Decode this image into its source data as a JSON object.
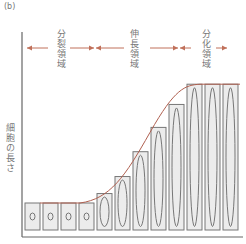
{
  "panel_label": "(b)",
  "y_axis_label": "細胞の長さ",
  "zones": [
    {
      "label": "分裂領域"
    },
    {
      "label": "伸長領域"
    },
    {
      "label": "分化領域"
    }
  ],
  "colors": {
    "arrow": "#c0705a",
    "curve": "#b06050",
    "cell_fill": "#ececec",
    "cell_stroke": "#777777",
    "axis": "#666666"
  },
  "chart_data": {
    "type": "diagram",
    "title": "",
    "ylabel": "細胞の長さ",
    "xlabel": "",
    "cells": [
      {
        "relative_length": 1.0
      },
      {
        "relative_length": 1.0
      },
      {
        "relative_length": 1.0
      },
      {
        "relative_length": 1.0
      },
      {
        "relative_length": 1.35
      },
      {
        "relative_length": 1.98
      },
      {
        "relative_length": 2.9
      },
      {
        "relative_length": 3.8
      },
      {
        "relative_length": 4.65
      },
      {
        "relative_length": 5.4
      },
      {
        "relative_length": 5.4
      },
      {
        "relative_length": 5.4
      }
    ],
    "zones": [
      "分裂領域",
      "伸長領域",
      "分化領域"
    ]
  }
}
